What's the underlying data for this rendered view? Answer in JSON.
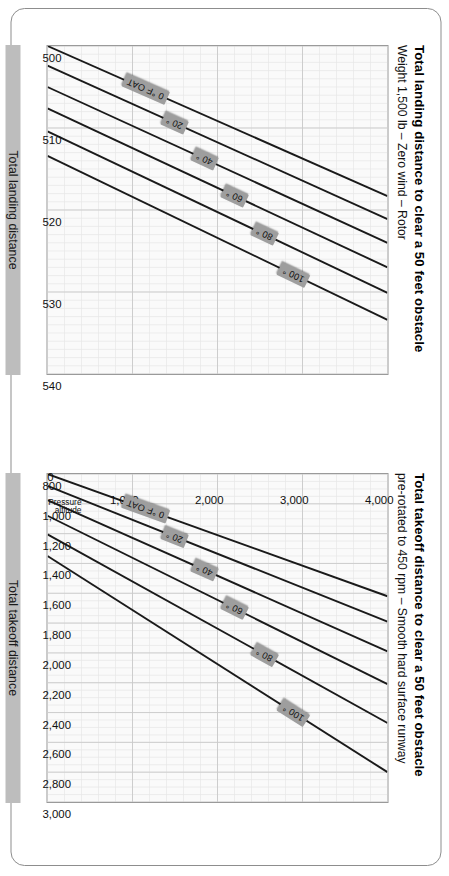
{
  "document": {
    "kind": "performance-chart-pair",
    "orientation": "landscape-rotated"
  },
  "panels": {
    "landing": {
      "title": "Total landing distance to clear a 50 feet obstacle",
      "subtitle": "Weight 1,500 lb – Zero wind – Rotor",
      "axis_title": "Total landing distance"
    },
    "takeoff": {
      "title": "Total takeoff distance to clear a 50 feet obstacle",
      "subtitle": "pre-rotated to 450 rpm – Smooth hard surface runway",
      "axis_title": "Total takeoff distance"
    }
  },
  "y_axis": {
    "label_line1": "Pressure",
    "label_line2": "altitude",
    "ticks": [
      "4,000",
      "3,000",
      "2,000",
      "1,000",
      "0"
    ]
  },
  "chart_data": [
    {
      "type": "line",
      "id": "landing",
      "title": "Total landing distance to clear a 50 feet obstacle",
      "subtitle": "Weight 1,500 lb – Zero wind – Rotor pre-rotated to 450 rpm – Smooth hard surface runway",
      "xlabel": "Total landing distance",
      "ylabel": "Pressure altitude",
      "xlim": [
        500,
        540
      ],
      "ylim": [
        0,
        4000
      ],
      "xticks": [
        500,
        510,
        520,
        530,
        540
      ],
      "xtick_labels": [
        "500",
        "510",
        "520",
        "530",
        "540"
      ],
      "yticks": [
        0,
        1000,
        2000,
        3000,
        4000
      ],
      "ytick_labels": [
        "0",
        "1,000",
        "2,000",
        "3,000",
        "4,000"
      ],
      "grid": true,
      "minor_grid": true,
      "legend": "inline-labels",
      "series": [
        {
          "name": "0 °F OAT",
          "x": [
            500.0,
            518.3
          ],
          "y": [
            0,
            4000
          ]
        },
        {
          "name": "20 °",
          "x": [
            502.4,
            521.1
          ],
          "y": [
            0,
            4000
          ]
        },
        {
          "name": "40 °",
          "x": [
            505.0,
            524.0
          ],
          "y": [
            0,
            4000
          ]
        },
        {
          "name": "60 °",
          "x": [
            507.6,
            527.0
          ],
          "y": [
            0,
            4000
          ]
        },
        {
          "name": "80 °",
          "x": [
            510.4,
            530.1
          ],
          "y": [
            0,
            4000
          ]
        },
        {
          "name": "100 °",
          "x": [
            513.4,
            533.4
          ],
          "y": [
            0,
            4000
          ]
        }
      ]
    },
    {
      "type": "line",
      "id": "takeoff",
      "title": "Total takeoff distance to clear a 50 feet obstacle",
      "subtitle": "Weight 1,500 lb – Zero wind – Rotor pre-rotated to 450 rpm – Smooth hard surface runway",
      "xlabel": "Total takeoff distance",
      "ylabel": "Pressure altitude",
      "xlim": [
        800,
        3000
      ],
      "ylim": [
        0,
        4000
      ],
      "xticks": [
        800,
        1000,
        1200,
        1400,
        1600,
        1800,
        2000,
        2200,
        2400,
        2600,
        2800,
        3000
      ],
      "xtick_labels": [
        "800",
        "1,000",
        "1,200",
        "1,400",
        "1,600",
        "1,800",
        "2,000",
        "2,200",
        "2,400",
        "2,600",
        "2,800",
        "3,000"
      ],
      "yticks": [
        0,
        1000,
        2000,
        3000,
        4000
      ],
      "ytick_labels": [
        "0",
        "1,000",
        "2,000",
        "3,000",
        "4,000"
      ],
      "grid": true,
      "minor_grid": true,
      "legend": "inline-labels",
      "series": [
        {
          "name": "0 °F OAT",
          "x": [
            800,
            1620
          ],
          "y": [
            0,
            4000
          ]
        },
        {
          "name": "20 °",
          "x": [
            880,
            1790
          ],
          "y": [
            0,
            4000
          ]
        },
        {
          "name": "40 °",
          "x": [
            975,
            1990
          ],
          "y": [
            0,
            4000
          ]
        },
        {
          "name": "60 °",
          "x": [
            1080,
            2210
          ],
          "y": [
            0,
            4000
          ]
        },
        {
          "name": "80 °",
          "x": [
            1205,
            2470
          ],
          "y": [
            0,
            4000
          ]
        },
        {
          "name": "100 °",
          "x": [
            1350,
            2800
          ],
          "y": [
            0,
            4000
          ]
        }
      ]
    }
  ],
  "curve_labels": [
    "0 °F OAT",
    "20 °",
    "40 °",
    "60 °",
    "80 °",
    "100 °"
  ],
  "colors": {
    "curve": "#1a1a1a",
    "plot_bg": "#fafafa",
    "grid_major": "#c9c9c9",
    "grid_minor": "#e6e6e6",
    "frame": "#9a9a9a",
    "card_border": "#8d8d8d",
    "axis_title_bg": "#bdbdbd",
    "chip_bg": "#9e9e9e"
  }
}
